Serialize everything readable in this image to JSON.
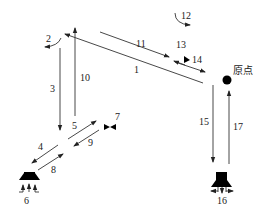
{
  "diagram": {
    "type": "motion-path-diagram",
    "origin_label": "原点",
    "paths": [
      {
        "id": "1",
        "label": "1",
        "description": "diagonal move from origin up-left to top-left corner"
      },
      {
        "id": "2",
        "label": "2",
        "description": "rotation at top-left corner"
      },
      {
        "id": "3",
        "label": "3",
        "description": "vertical descent on left"
      },
      {
        "id": "4",
        "label": "4",
        "description": "diagonal move down-left to left gripper station"
      },
      {
        "id": "5",
        "label": "5",
        "description": "diagonal move up-right toward valve 7"
      },
      {
        "id": "6",
        "label": "6",
        "description": "left gripper / suction station (grip)"
      },
      {
        "id": "7",
        "label": "7",
        "description": "valve symbol"
      },
      {
        "id": "8",
        "label": "8",
        "description": "diagonal move up-right from left station"
      },
      {
        "id": "9",
        "label": "9",
        "description": "diagonal move down-left from valve 7"
      },
      {
        "id": "10",
        "label": "10",
        "description": "vertical ascent on left"
      },
      {
        "id": "11",
        "label": "11",
        "description": "diagonal move down-right on top"
      },
      {
        "id": "12",
        "label": "12",
        "description": "rotation at top"
      },
      {
        "id": "13",
        "label": "13",
        "description": "top label"
      },
      {
        "id": "14",
        "label": "14",
        "description": "valve / flag indicator near top right"
      },
      {
        "id": "15",
        "label": "15",
        "description": "vertical descent on right to right station"
      },
      {
        "id": "16",
        "label": "16",
        "description": "right gripper / suction station (release)"
      },
      {
        "id": "17",
        "label": "17",
        "description": "vertical ascent on right to origin"
      }
    ],
    "labels": {
      "l1": "1",
      "l2": "2",
      "l3": "3",
      "l4": "4",
      "l5": "5",
      "l6": "6",
      "l7": "7",
      "l8": "8",
      "l9": "9",
      "l10": "10",
      "l11": "11",
      "l12": "12",
      "l13": "13",
      "l14": "14",
      "l15": "15",
      "l16": "16",
      "l17": "17"
    },
    "colors": {
      "line": "#333333",
      "fill": "#000000",
      "background": "#ffffff"
    }
  }
}
